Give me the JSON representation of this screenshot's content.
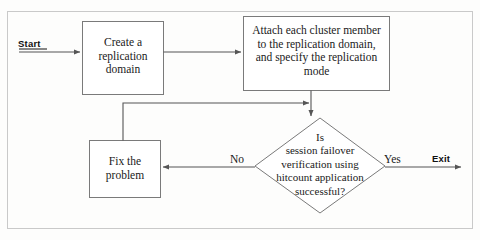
{
  "diagram": {
    "type": "flowchart",
    "frame": {
      "stroke_color": "#c9c9c9"
    },
    "stroke_color": "#7a7a7a",
    "text_color": "#1a1a1a",
    "background_color": "#fdfdfc",
    "terminals": {
      "start": "Start",
      "exit": "Exit"
    },
    "nodes": [
      {
        "id": "create-replication-domain",
        "shape": "process",
        "label": "Create a\nreplication\ndomain"
      },
      {
        "id": "attach-cluster-members",
        "shape": "process",
        "label": "Attach each cluster member\nto the replication domain,\nand specify the replication\nmode"
      },
      {
        "id": "failover-verification-decision",
        "shape": "decision",
        "label": "Is\nsession failover\nverification using\nhitcount application\nsuccessful?"
      },
      {
        "id": "fix-the-problem",
        "shape": "process",
        "label": "Fix the\nproblem"
      }
    ],
    "edges": [
      {
        "id": "start-to-create",
        "from": "start",
        "to": "create-replication-domain",
        "label": ""
      },
      {
        "id": "create-to-attach",
        "from": "create-replication-domain",
        "to": "attach-cluster-members",
        "label": ""
      },
      {
        "id": "attach-to-decision",
        "from": "attach-cluster-members",
        "to": "failover-verification-decision",
        "label": ""
      },
      {
        "id": "decision-no-to-fix",
        "from": "failover-verification-decision",
        "to": "fix-the-problem",
        "label": "No"
      },
      {
        "id": "fix-to-decision-loop",
        "from": "fix-the-problem",
        "to": "attach-to-decision",
        "label": ""
      },
      {
        "id": "decision-yes-to-exit",
        "from": "failover-verification-decision",
        "to": "exit",
        "label": "Yes"
      }
    ]
  }
}
